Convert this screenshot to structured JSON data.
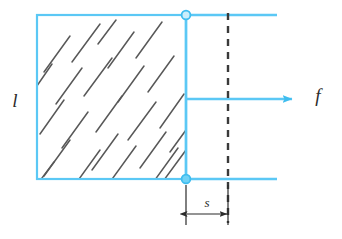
{
  "figure": {
    "type": "physics-diagram",
    "background_color": "#ffffff",
    "colors": {
      "frame_blue": "#5BC8F5",
      "frame_blue_light": "#9FDFF8",
      "hatch_gray": "#4a4a4a",
      "dimension_black": "#2b2b2b",
      "dashed_black": "#3a3a3a",
      "label_color": "#2b2b2b"
    },
    "labels": {
      "length_label": "l",
      "force_label": "f",
      "displacement_label": "s"
    },
    "elements": {
      "film_rectangle": {
        "name": "soap-film",
        "x": 37,
        "y": 15,
        "width": 149,
        "height": 164,
        "hatched": true
      },
      "top_rail": {
        "x1": 186,
        "y1": 15,
        "x2": 277,
        "y2": 15
      },
      "bottom_rail": {
        "x1": 186,
        "y1": 179,
        "x2": 277,
        "y2": 179
      },
      "slider_bar": {
        "x": 186,
        "y1": 15,
        "y2": 179
      },
      "node_top": {
        "cx": 186,
        "cy": 15,
        "r": 4.5
      },
      "node_bottom": {
        "cx": 186,
        "cy": 179,
        "r": 4.5
      },
      "force_arrow": {
        "x1": 186,
        "y1": 99,
        "x2": 297,
        "y2": 99
      },
      "dashed_reference_line": {
        "x": 228,
        "y1": 14,
        "y2": 222
      },
      "dimension_line": {
        "x1": 186,
        "x2": 228,
        "y": 214
      },
      "extension_left": {
        "x": 186,
        "y1": 186,
        "y2": 224
      },
      "extension_right": {
        "x": 228,
        "y1": 186,
        "y2": 224
      }
    },
    "hatch_marks": {
      "angle_deg": 55,
      "count": 24,
      "description": "short parallel diagonal dashes indicating soap film"
    }
  }
}
